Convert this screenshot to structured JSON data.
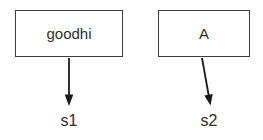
{
  "diagram": {
    "nodes": [
      {
        "id": "node-1",
        "label": "goodhi"
      },
      {
        "id": "node-2",
        "label": "A"
      }
    ],
    "targets": [
      {
        "id": "target-1",
        "label": "s1"
      },
      {
        "id": "target-2",
        "label": "s2"
      }
    ],
    "edges": [
      {
        "from": "goodhi",
        "to": "s1",
        "style": "arrow-down"
      },
      {
        "from": "A",
        "to": "s2",
        "style": "arrow-down-right"
      }
    ],
    "colors": {
      "stroke": "#3f3f3f",
      "arrow": "#1a1a1a",
      "text": "#2e2e2e",
      "background": "#ffffff"
    }
  }
}
